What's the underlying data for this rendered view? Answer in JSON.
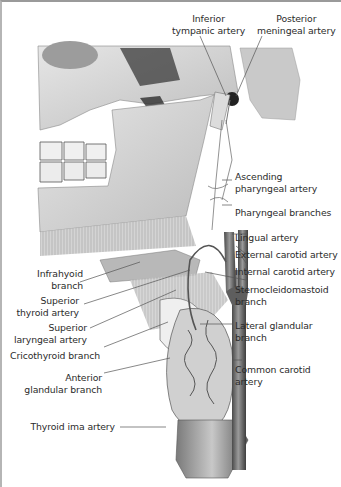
{
  "figure": {
    "labels_top": [
      {
        "id": "inferior-tympanic-artery",
        "lines": [
          "Inferior",
          "tympanic artery"
        ]
      },
      {
        "id": "posterior-meningeal-artery",
        "lines": [
          "Posterior",
          "meningeal artery"
        ]
      }
    ],
    "labels_right": [
      {
        "id": "ascending-pharyngeal-artery",
        "lines": [
          "Ascending",
          "pharyngeal artery"
        ]
      },
      {
        "id": "pharyngeal-branches",
        "lines": [
          "Pharyngeal branches"
        ]
      },
      {
        "id": "lingual-artery",
        "lines": [
          "Lingual artery"
        ]
      },
      {
        "id": "external-carotid-artery",
        "lines": [
          "External carotid artery"
        ]
      },
      {
        "id": "internal-carotid-artery",
        "lines": [
          "Internal carotid artery"
        ]
      },
      {
        "id": "sternocleidomastoid-branch",
        "lines": [
          "Sternocleidomastoid",
          "branch"
        ]
      },
      {
        "id": "lateral-glandular-branch",
        "lines": [
          "Lateral glandular",
          "branch"
        ]
      },
      {
        "id": "common-carotid-artery",
        "lines": [
          "Common carotid",
          "artery"
        ]
      }
    ],
    "labels_left": [
      {
        "id": "infrahyoid-branch",
        "lines": [
          "Infrahyoid",
          "branch"
        ]
      },
      {
        "id": "superior-thyroid-artery",
        "lines": [
          "Superior",
          "thyroid artery"
        ]
      },
      {
        "id": "superior-laryngeal-artery",
        "lines": [
          "Superior",
          "laryngeal artery"
        ]
      },
      {
        "id": "cricothyroid-branch",
        "lines": [
          "Cricothyroid branch"
        ]
      },
      {
        "id": "anterior-glandular-branch",
        "lines": [
          "Anterior",
          "glandular branch"
        ]
      },
      {
        "id": "thyroid-ima-artery",
        "lines": [
          "Thyroid ima artery"
        ]
      }
    ],
    "colors": {
      "background": "#ffffff",
      "bone": "#d9d9d9",
      "bone_shadow": "#8c8c8c",
      "vessel": "#6f6f6f",
      "leader_line": "#555555",
      "text": "#2b2b2b"
    }
  }
}
